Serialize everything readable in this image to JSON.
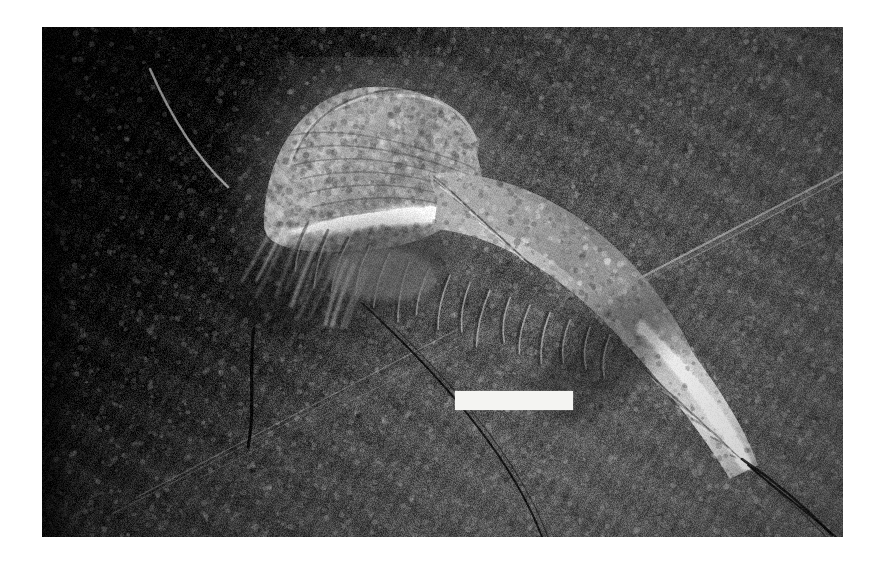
{
  "image": {
    "kind": "photograph",
    "subject": "fossil-arthropod-on-shale",
    "rendering": "grayscale",
    "caption_text": "",
    "width_px": 881,
    "height_px": 562
  },
  "plate": {
    "name": "fossil photograph plate",
    "left_px": 42,
    "top_px": 27,
    "width_px": 801,
    "height_px": 510,
    "border_color": "#ffffff",
    "matrix_color_dark": "#141414",
    "matrix_color_mid": "#4a4a4a",
    "matrix_color_light": "#6e6e6e"
  },
  "scale_bar": {
    "label": "",
    "color": "#f4f4f2",
    "left_px": 455,
    "top_px": 391,
    "width_px": 118,
    "height_px": 19
  },
  "specimen": {
    "name": "arthropod fossil",
    "parts": [
      {
        "name": "antenna",
        "description": "thin pale curved filament extending to upper left"
      },
      {
        "name": "cephalon",
        "description": "rounded dome-shaped head shield, pale grey"
      },
      {
        "name": "appendages",
        "description": "radiating limb impressions below the head"
      },
      {
        "name": "trunk",
        "description": "segmented body tapering to lower right"
      },
      {
        "name": "telson",
        "description": "narrow tail spine terminating at lower right"
      }
    ],
    "highlight_color": "#f0efe9",
    "body_color": "#9c9c96",
    "shadow_color": "#2a2a2a"
  },
  "matrix_features": [
    {
      "name": "cleavage-streak-upper-right",
      "description": "bright diagonal slickenside streak"
    },
    {
      "name": "cleavage-streak-lower-left",
      "description": "pair of fine pale diagonal lines"
    },
    {
      "name": "vertical-crack",
      "description": "dark near-vertical fissure, left of centre"
    },
    {
      "name": "diagonal-crack",
      "description": "dark crack running from centre to lower edge"
    }
  ]
}
